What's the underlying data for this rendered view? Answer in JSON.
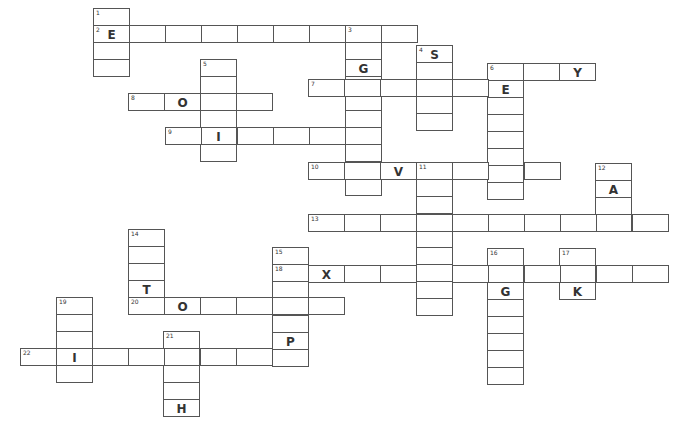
{
  "puzzle": {
    "type": "crossword",
    "cell_width": 36,
    "cell_height": 17,
    "colors": {
      "border": "#555555",
      "text": "#333333",
      "background": "#ffffff"
    },
    "entries": [
      {
        "number": "1",
        "direction": "down",
        "x": 93,
        "y": 8,
        "length": 4,
        "letters": {
          "1": "E"
        }
      },
      {
        "number": "2",
        "direction": "across",
        "x": 93,
        "y": 25,
        "length": 9,
        "letters": {
          "0": "E"
        }
      },
      {
        "number": "3",
        "direction": "down",
        "x": 345,
        "y": 25,
        "length": 10,
        "letters": {
          "2": "G"
        }
      },
      {
        "number": "4",
        "direction": "down",
        "x": 416,
        "y": 45,
        "length": 5,
        "letters": {
          "0": "S"
        }
      },
      {
        "number": "5",
        "direction": "down",
        "x": 200,
        "y": 59,
        "length": 6,
        "letters": {
          "4": "I"
        }
      },
      {
        "number": "6",
        "direction": "across",
        "x": 487,
        "y": 63,
        "length": 3,
        "letters": {
          "2": "Y"
        }
      },
      {
        "number": "6",
        "direction": "down",
        "x": 487,
        "y": 63,
        "length": 8,
        "letters": {
          "1": "E"
        }
      },
      {
        "number": "7",
        "direction": "across",
        "x": 308,
        "y": 79,
        "length": 6,
        "letters": {}
      },
      {
        "number": "8",
        "direction": "across",
        "x": 128,
        "y": 93,
        "length": 4,
        "letters": {
          "1": "O"
        }
      },
      {
        "number": "9",
        "direction": "across",
        "x": 165,
        "y": 127,
        "length": 6,
        "letters": {
          "1": "I"
        }
      },
      {
        "number": "10",
        "direction": "across",
        "x": 308,
        "y": 162,
        "length": 7,
        "letters": {
          "2": "V"
        }
      },
      {
        "number": "11",
        "direction": "down",
        "x": 416,
        "y": 162,
        "length": 9,
        "letters": {
          "3": "R"
        }
      },
      {
        "number": "12",
        "direction": "down",
        "x": 595,
        "y": 163,
        "length": 4,
        "letters": {
          "1": "A"
        }
      },
      {
        "number": "13",
        "direction": "across",
        "x": 308,
        "y": 214,
        "length": 10,
        "letters": {}
      },
      {
        "number": "14",
        "direction": "down",
        "x": 128,
        "y": 229,
        "length": 5,
        "letters": {
          "3": "T"
        }
      },
      {
        "number": "15",
        "direction": "down",
        "x": 272,
        "y": 247,
        "length": 7,
        "letters": {
          "5": "P"
        }
      },
      {
        "number": "16",
        "direction": "down",
        "x": 487,
        "y": 248,
        "length": 8,
        "letters": {
          "2": "G"
        }
      },
      {
        "number": "17",
        "direction": "down",
        "x": 559,
        "y": 248,
        "length": 3,
        "letters": {
          "2": "K"
        }
      },
      {
        "number": "18",
        "direction": "across",
        "x": 272,
        "y": 265,
        "length": 11,
        "letters": {
          "1": "X"
        }
      },
      {
        "number": "19",
        "direction": "down",
        "x": 56,
        "y": 297,
        "length": 5,
        "letters": {}
      },
      {
        "number": "20",
        "direction": "across",
        "x": 128,
        "y": 297,
        "length": 6,
        "letters": {
          "1": "O"
        }
      },
      {
        "number": "21",
        "direction": "down",
        "x": 163,
        "y": 331,
        "length": 5,
        "letters": {
          "4": "H"
        }
      },
      {
        "number": "22",
        "direction": "across",
        "x": 20,
        "y": 348,
        "length": 8,
        "letters": {
          "1": "I"
        }
      }
    ]
  }
}
